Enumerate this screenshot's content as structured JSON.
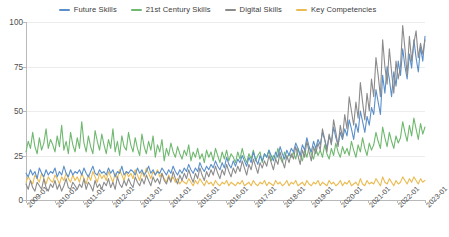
{
  "legend": {
    "position": "top-center",
    "items": [
      {
        "label": "Future Skills",
        "color": "#5b8fc9"
      },
      {
        "label": "21st Century Skills",
        "color": "#6fb86f"
      },
      {
        "label": "Digital Skills",
        "color": "#8b8b8b"
      },
      {
        "label": "Key Competencies",
        "color": "#e9bb52"
      }
    ]
  },
  "chart_data": {
    "type": "line",
    "title": "",
    "subtitle": "",
    "xlabel": "",
    "ylabel": "",
    "ylim": [
      0,
      100
    ],
    "yticks": [
      0,
      25,
      50,
      75,
      100
    ],
    "grid": true,
    "legend_position": "top-center",
    "xticks": [
      "2009-01",
      "2010-01",
      "2011-01",
      "2012-01",
      "2013-01",
      "2014-01",
      "2015-01",
      "2016-01",
      "2017-01",
      "2018-01",
      "2019-01",
      "2020-01",
      "2021-01",
      "2022-01",
      "2023-01"
    ],
    "x_start": "2009-01",
    "x_end": "2023-01",
    "x_frequency": "monthly",
    "series": [
      {
        "name": "Future Skills",
        "color": "#5b8fc9",
        "values": [
          15,
          13,
          17,
          14,
          16,
          12,
          18,
          15,
          13,
          17,
          14,
          16,
          15,
          18,
          13,
          16,
          14,
          19,
          15,
          13,
          17,
          14,
          16,
          15,
          17,
          14,
          18,
          15,
          13,
          16,
          19,
          15,
          14,
          17,
          15,
          16,
          14,
          18,
          15,
          17,
          13,
          16,
          15,
          19,
          14,
          16,
          15,
          17,
          16,
          14,
          18,
          15,
          17,
          14,
          16,
          19,
          15,
          17,
          14,
          16,
          15,
          18,
          16,
          14,
          17,
          15,
          19,
          16,
          14,
          17,
          15,
          18,
          16,
          20,
          17,
          15,
          18,
          16,
          21,
          18,
          16,
          19,
          17,
          20,
          18,
          22,
          19,
          17,
          21,
          18,
          24,
          20,
          18,
          22,
          19,
          23,
          21,
          25,
          22,
          19,
          24,
          21,
          27,
          23,
          20,
          25,
          22,
          26,
          24,
          28,
          25,
          22,
          27,
          24,
          30,
          26,
          23,
          28,
          25,
          29,
          27,
          32,
          29,
          25,
          31,
          28,
          35,
          30,
          27,
          33,
          29,
          34,
          31,
          38,
          34,
          29,
          36,
          32,
          41,
          35,
          31,
          38,
          34,
          40,
          36,
          45,
          40,
          34,
          43,
          38,
          50,
          44,
          38,
          47,
          42,
          52,
          48,
          62,
          55,
          48,
          70,
          60,
          75,
          68,
          58,
          72,
          64,
          78,
          70,
          85,
          75,
          68,
          82,
          74,
          90,
          80,
          72,
          86,
          78,
          92
        ]
      },
      {
        "name": "21st Century Skills",
        "color": "#6fb86f",
        "values": [
          27,
          33,
          29,
          38,
          30,
          26,
          35,
          28,
          32,
          40,
          29,
          34,
          31,
          27,
          36,
          30,
          42,
          28,
          33,
          26,
          38,
          31,
          27,
          35,
          29,
          44,
          32,
          27,
          36,
          30,
          26,
          39,
          33,
          28,
          37,
          31,
          26,
          34,
          29,
          40,
          27,
          33,
          25,
          36,
          30,
          28,
          38,
          31,
          27,
          35,
          29,
          25,
          37,
          30,
          26,
          33,
          28,
          36,
          24,
          31,
          27,
          34,
          22,
          29,
          25,
          32,
          27,
          24,
          30,
          26,
          23,
          28,
          25,
          31,
          22,
          27,
          24,
          29,
          23,
          26,
          21,
          28,
          24,
          27,
          22,
          29,
          25,
          21,
          27,
          23,
          28,
          22,
          26,
          24,
          21,
          27,
          23,
          29,
          24,
          21,
          26,
          23,
          28,
          22,
          25,
          27,
          21,
          26,
          24,
          28,
          22,
          25,
          23,
          29,
          24,
          21,
          27,
          23,
          26,
          24,
          27,
          23,
          29,
          25,
          22,
          28,
          24,
          30,
          26,
          23,
          29,
          25,
          28,
          24,
          31,
          26,
          23,
          29,
          25,
          32,
          27,
          24,
          30,
          26,
          29,
          25,
          33,
          28,
          24,
          31,
          27,
          35,
          29,
          25,
          32,
          28,
          31,
          38,
          33,
          29,
          41,
          35,
          30,
          38,
          33,
          29,
          36,
          32,
          35,
          44,
          38,
          33,
          42,
          36,
          46,
          40,
          34,
          43,
          37,
          41
        ]
      },
      {
        "name": "Digital Skills",
        "color": "#8b8b8b",
        "values": [
          9,
          6,
          11,
          7,
          5,
          10,
          8,
          6,
          12,
          7,
          5,
          9,
          7,
          11,
          6,
          9,
          5,
          8,
          12,
          7,
          6,
          10,
          8,
          6,
          9,
          7,
          12,
          6,
          10,
          8,
          5,
          11,
          7,
          9,
          6,
          10,
          8,
          12,
          7,
          10,
          6,
          13,
          9,
          7,
          11,
          8,
          12,
          9,
          7,
          13,
          10,
          8,
          12,
          9,
          14,
          11,
          8,
          13,
          10,
          12,
          9,
          15,
          11,
          9,
          13,
          10,
          16,
          12,
          9,
          14,
          11,
          15,
          12,
          17,
          13,
          10,
          15,
          12,
          18,
          14,
          11,
          16,
          13,
          17,
          14,
          19,
          15,
          12,
          17,
          14,
          20,
          16,
          13,
          18,
          15,
          19,
          16,
          22,
          18,
          14,
          20,
          17,
          23,
          19,
          15,
          21,
          18,
          22,
          19,
          25,
          21,
          17,
          23,
          20,
          27,
          22,
          18,
          25,
          21,
          26,
          23,
          30,
          25,
          20,
          28,
          24,
          33,
          27,
          22,
          30,
          26,
          32,
          28,
          40,
          34,
          27,
          37,
          31,
          45,
          38,
          30,
          42,
          35,
          48,
          40,
          58,
          50,
          42,
          55,
          46,
          66,
          55,
          45,
          60,
          50,
          68,
          58,
          80,
          70,
          58,
          90,
          75,
          65,
          85,
          72,
          60,
          78,
          68,
          75,
          98,
          85,
          70,
          92,
          78,
          88,
          95,
          80,
          88,
          82,
          90
        ]
      },
      {
        "name": "Key Competencies",
        "color": "#e9bb52",
        "values": [
          10,
          13,
          11,
          9,
          14,
          12,
          10,
          15,
          12,
          9,
          13,
          11,
          10,
          14,
          12,
          9,
          13,
          11,
          15,
          12,
          10,
          14,
          11,
          13,
          10,
          15,
          12,
          9,
          14,
          11,
          16,
          13,
          10,
          15,
          12,
          14,
          11,
          16,
          13,
          10,
          15,
          12,
          17,
          14,
          11,
          16,
          13,
          15,
          12,
          17,
          14,
          11,
          16,
          13,
          18,
          15,
          12,
          16,
          14,
          17,
          13,
          15,
          12,
          10,
          14,
          11,
          13,
          10,
          12,
          9,
          11,
          10,
          9,
          12,
          10,
          8,
          11,
          9,
          12,
          10,
          8,
          11,
          9,
          10,
          8,
          11,
          9,
          8,
          10,
          9,
          11,
          8,
          10,
          9,
          8,
          10,
          9,
          11,
          8,
          9,
          10,
          8,
          11,
          9,
          8,
          10,
          9,
          11,
          8,
          10,
          9,
          8,
          11,
          9,
          10,
          8,
          9,
          11,
          8,
          10,
          9,
          11,
          8,
          9,
          10,
          8,
          11,
          9,
          8,
          10,
          9,
          11,
          8,
          10,
          9,
          8,
          11,
          9,
          10,
          8,
          9,
          11,
          8,
          10,
          9,
          11,
          8,
          9,
          10,
          8,
          12,
          9,
          8,
          11,
          9,
          10,
          9,
          12,
          10,
          8,
          13,
          10,
          9,
          12,
          10,
          8,
          11,
          9,
          10,
          13,
          11,
          9,
          12,
          10,
          13,
          11,
          9,
          12,
          10,
          11
        ]
      }
    ]
  }
}
